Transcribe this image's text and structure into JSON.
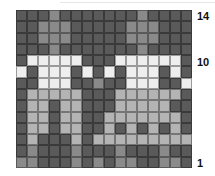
{
  "colors": {
    "D": "#5a5a5a",
    "M": "#8a8a8a",
    "L": "#b4b4b4",
    "W": "#eeeeee"
  },
  "row_labels": {
    "top": "14",
    "mid": "10",
    "bottom": "1"
  },
  "grid": {
    "columns": 16,
    "rows_top_to_bottom": [
      "DDDMDDDDDDDMDDDD",
      "DDMMMDDDDDMMMDDD",
      "DDMMMDDDDDMMMDDD",
      "DDDMDDDDDDDMDDDD",
      "DWWWWWDDDWWWWWWD",
      "WDWWWDWDWDWWWDWD",
      "DDWWWDDMDDWWWDDW",
      "DLLLLLDDDLLLLLLD",
      "DLLDLLDDDLLLLLDD",
      "DLLDLLDDLLLLLLLD",
      "DLLDLLDDLDLDLDLD",
      "DLDDDLDLLLLLLLLL",
      "DMDDDMDDDMDDDMDD",
      "MMDDDMDMDMMDDMMD"
    ]
  }
}
